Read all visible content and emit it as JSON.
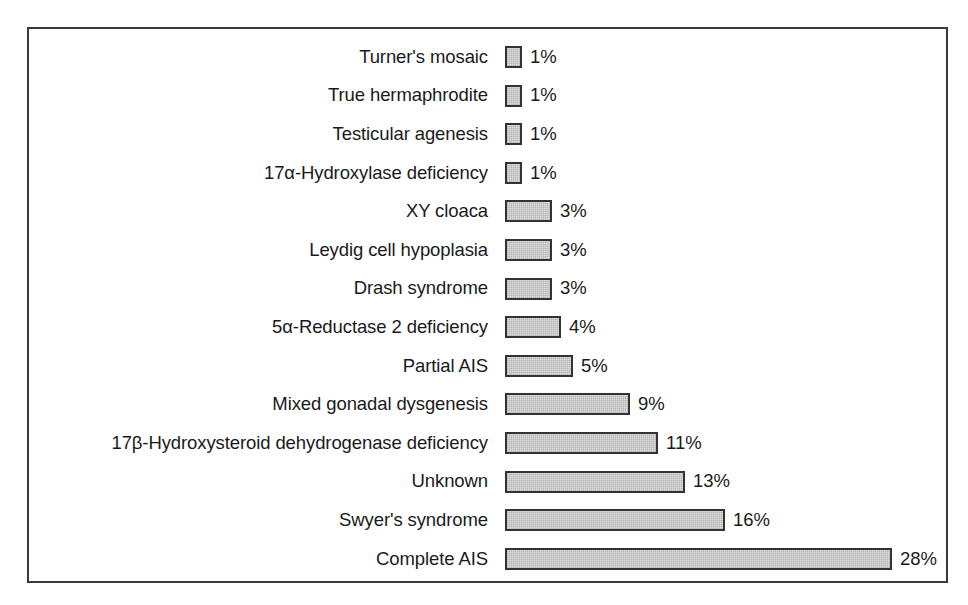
{
  "chart_data": {
    "type": "bar",
    "orientation": "horizontal",
    "title": "",
    "subtitle": "",
    "xlabel": "",
    "ylabel": "",
    "grid": false,
    "legend": null,
    "axis_visible": false,
    "value_suffix": "%",
    "xlim": [
      0,
      28
    ],
    "categories": [
      "Turner's mosaic",
      "True hermaphrodite",
      "Testicular agenesis",
      "17α-Hydroxylase deficiency",
      "XY cloaca",
      "Leydig cell hypoplasia",
      "Drash syndrome",
      "5α-Reductase 2 deficiency",
      "Partial AIS",
      "Mixed gonadal dysgenesis",
      "17β-Hydroxysteroid dehydrogenase deficiency",
      "Unknown",
      "Swyer's syndrome",
      "Complete AIS"
    ],
    "values": [
      1,
      1,
      1,
      1,
      3,
      3,
      3,
      4,
      5,
      9,
      11,
      13,
      16,
      28
    ],
    "value_labels": [
      "1%",
      "1%",
      "1%",
      "1%",
      "3%",
      "3%",
      "3%",
      "4%",
      "5%",
      "9%",
      "11%",
      "13%",
      "16%",
      "28%"
    ],
    "bar_pixel_widths": [
      17,
      17,
      17,
      17,
      47,
      47,
      47,
      56,
      68,
      125,
      153,
      180,
      220,
      387
    ],
    "bars": [
      {
        "label": "Turner's mosaic",
        "value": 1,
        "value_label": "1%",
        "px": 17
      },
      {
        "label": "True hermaphrodite",
        "value": 1,
        "value_label": "1%",
        "px": 17
      },
      {
        "label": "Testicular agenesis",
        "value": 1,
        "value_label": "1%",
        "px": 17
      },
      {
        "label": "17α-Hydroxylase deficiency",
        "value": 1,
        "value_label": "1%",
        "px": 17
      },
      {
        "label": "XY cloaca",
        "value": 3,
        "value_label": "3%",
        "px": 47
      },
      {
        "label": "Leydig cell hypoplasia",
        "value": 3,
        "value_label": "3%",
        "px": 47
      },
      {
        "label": "Drash syndrome",
        "value": 3,
        "value_label": "3%",
        "px": 47
      },
      {
        "label": "5α-Reductase 2 deficiency",
        "value": 4,
        "value_label": "4%",
        "px": 56
      },
      {
        "label": "Partial AIS",
        "value": 5,
        "value_label": "5%",
        "px": 68
      },
      {
        "label": "Mixed gonadal dysgenesis",
        "value": 9,
        "value_label": "9%",
        "px": 125
      },
      {
        "label": "17β-Hydroxysteroid dehydrogenase deficiency",
        "value": 11,
        "value_label": "11%",
        "px": 153
      },
      {
        "label": "Unknown",
        "value": 13,
        "value_label": "13%",
        "px": 180
      },
      {
        "label": "Swyer's syndrome",
        "value": 16,
        "value_label": "16%",
        "px": 220
      },
      {
        "label": "Complete AIS",
        "value": 28,
        "value_label": "28%",
        "px": 387
      }
    ],
    "colors": {
      "bar_fill": "#dedede",
      "bar_stroke": "#333333",
      "frame_stroke": "#3a3a3a",
      "text": "#1a1a1a",
      "background": "#ffffff"
    }
  }
}
